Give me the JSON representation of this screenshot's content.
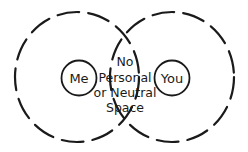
{
  "diagram": {
    "left_person": {
      "label": "Me"
    },
    "right_person": {
      "label": "You"
    },
    "center_text": {
      "lines": [
        "No",
        "Personal",
        "or Neutral",
        "Space"
      ]
    },
    "colors": {
      "stroke": "#1a1a1a",
      "background": "#ffffff"
    }
  }
}
